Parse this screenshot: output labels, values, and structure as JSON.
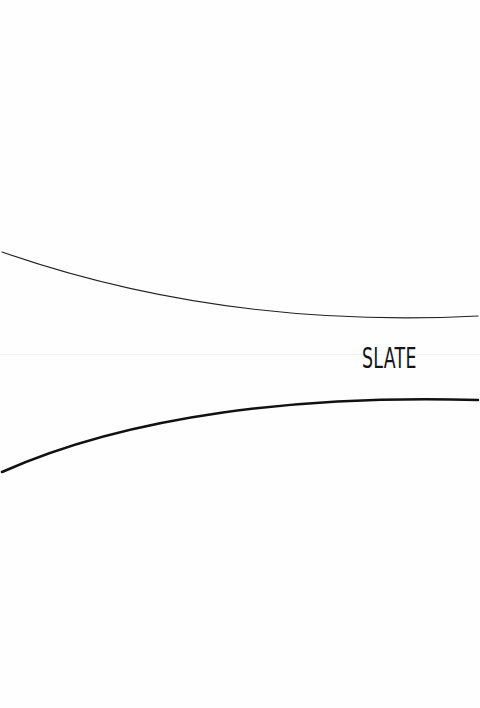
{
  "page": {
    "background": "#fefefe",
    "brand": {
      "text": "SLATE",
      "color": "#141414"
    },
    "curves": [
      {
        "name": "top-curve",
        "stroke": "#222222",
        "width": 1.2,
        "path": "M 2 252 C 140 300, 300 325, 478 316"
      },
      {
        "name": "bottom-curve",
        "stroke": "#111111",
        "width": 2.6,
        "path": "M 2 472 C 130 415, 300 395, 478 400"
      }
    ]
  }
}
